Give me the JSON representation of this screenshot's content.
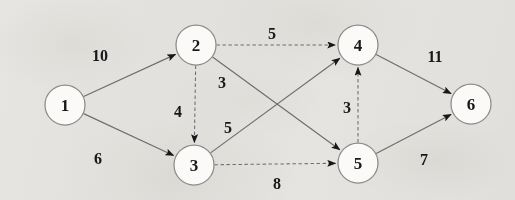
{
  "diagram": {
    "type": "directed-weighted-graph",
    "background_color": "#f2f1ef",
    "node_fill_color": "#fbfaf9",
    "node_stroke_color": "#8d8b88",
    "edge_color": "#6f6d6b",
    "text_color": "#18171a",
    "nodes": [
      {
        "id": "1",
        "label": "1",
        "cx": 65,
        "cy": 105,
        "r": 20
      },
      {
        "id": "2",
        "label": "2",
        "cx": 196,
        "cy": 45,
        "r": 20
      },
      {
        "id": "3",
        "label": "3",
        "cx": 194,
        "cy": 165,
        "r": 20
      },
      {
        "id": "4",
        "label": "4",
        "cx": 358,
        "cy": 45,
        "r": 20
      },
      {
        "id": "5",
        "label": "5",
        "cx": 358,
        "cy": 163,
        "r": 20
      },
      {
        "id": "6",
        "label": "6",
        "cx": 471,
        "cy": 104,
        "r": 20
      }
    ],
    "edges": [
      {
        "id": "e-1-2",
        "from": "1",
        "to": "2",
        "weight": "10",
        "style": "solid",
        "label_x": 100,
        "label_y": 55
      },
      {
        "id": "e-1-3",
        "from": "1",
        "to": "3",
        "weight": "6",
        "style": "solid",
        "label_x": 98,
        "label_y": 158
      },
      {
        "id": "e-2-3",
        "from": "2",
        "to": "3",
        "weight": "4",
        "style": "dashed",
        "label_x": 178,
        "label_y": 111
      },
      {
        "id": "e-2-4",
        "from": "2",
        "to": "4",
        "weight": "5",
        "style": "dashed",
        "label_x": 272,
        "label_y": 33
      },
      {
        "id": "e-2-5",
        "from": "2",
        "to": "5",
        "weight": "3",
        "style": "solid",
        "label_x": 222,
        "label_y": 82
      },
      {
        "id": "e-3-4",
        "from": "3",
        "to": "4",
        "weight": "5",
        "style": "solid",
        "label_x": 228,
        "label_y": 127
      },
      {
        "id": "e-3-5",
        "from": "3",
        "to": "5",
        "weight": "8",
        "style": "dashed",
        "label_x": 277,
        "label_y": 183
      },
      {
        "id": "e-5-4",
        "from": "5",
        "to": "4",
        "weight": "3",
        "style": "dashed",
        "label_x": 347,
        "label_y": 107
      },
      {
        "id": "e-4-6",
        "from": "4",
        "to": "6",
        "weight": "11",
        "style": "solid",
        "label_x": 435,
        "label_y": 56
      },
      {
        "id": "e-5-6",
        "from": "5",
        "to": "6",
        "weight": "7",
        "style": "solid",
        "label_x": 424,
        "label_y": 159
      }
    ]
  }
}
